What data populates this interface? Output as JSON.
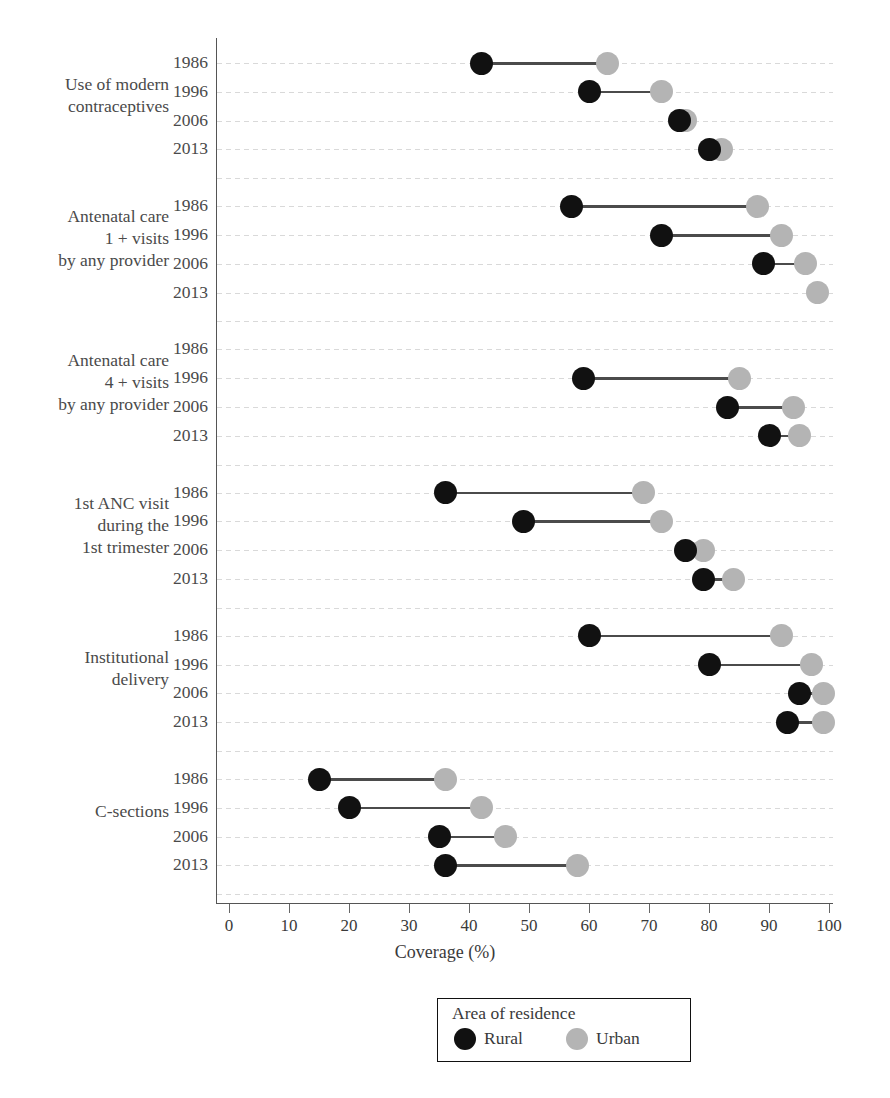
{
  "chart_data": {
    "type": "scatter",
    "subtype": "dumbbell",
    "title": "",
    "xlabel": "Coverage (%)",
    "ylabel": "",
    "xlim": [
      0,
      100
    ],
    "xticks": [
      0,
      10,
      20,
      30,
      40,
      50,
      60,
      70,
      80,
      90,
      100
    ],
    "grid": true,
    "legend": {
      "title": "Area of residence",
      "position": "bottom-center",
      "entries": [
        {
          "name": "Rural",
          "color": "#111111"
        },
        {
          "name": "Urban",
          "color": "#b4b4b4"
        }
      ]
    },
    "series": [
      {
        "name": "Rural",
        "color": "#111111"
      },
      {
        "name": "Urban",
        "color": "#b4b4b4"
      }
    ],
    "groups": [
      {
        "label": "Use of modern\ncontraceptives",
        "label_lines": [
          "Use of modern",
          "contraceptives"
        ],
        "rows": [
          {
            "year": "1986",
            "Rural": 42,
            "Urban": 63
          },
          {
            "year": "1996",
            "Rural": 60,
            "Urban": 72
          },
          {
            "year": "2006",
            "Rural": 75,
            "Urban": 76
          },
          {
            "year": "2013",
            "Rural": 80,
            "Urban": 82
          }
        ]
      },
      {
        "label": "Antenatal care\n1 + visits\nby any provider",
        "label_lines": [
          "Antenatal care",
          "1 + visits",
          "by any provider"
        ],
        "rows": [
          {
            "year": "1986",
            "Rural": 57,
            "Urban": 88
          },
          {
            "year": "1996",
            "Rural": 72,
            "Urban": 92
          },
          {
            "year": "2006",
            "Rural": 89,
            "Urban": 96
          },
          {
            "year": "2013",
            "Rural": null,
            "Urban": 98
          }
        ]
      },
      {
        "label": "Antenatal care\n4 + visits\nby any provider",
        "label_lines": [
          "Antenatal care",
          "4 + visits",
          "by any provider"
        ],
        "rows": [
          {
            "year": "1986",
            "Rural": null,
            "Urban": null
          },
          {
            "year": "1996",
            "Rural": 59,
            "Urban": 85
          },
          {
            "year": "2006",
            "Rural": 83,
            "Urban": 94
          },
          {
            "year": "2013",
            "Rural": 90,
            "Urban": 95
          }
        ]
      },
      {
        "label": "1st ANC visit\nduring the\n1st trimester",
        "label_lines": [
          "1st ANC visit",
          "during the",
          "1st trimester"
        ],
        "rows": [
          {
            "year": "1986",
            "Rural": 36,
            "Urban": 69
          },
          {
            "year": "1996",
            "Rural": 49,
            "Urban": 72
          },
          {
            "year": "2006",
            "Rural": 76,
            "Urban": 79
          },
          {
            "year": "2013",
            "Rural": 79,
            "Urban": 84
          }
        ]
      },
      {
        "label": "Institutional\ndelivery",
        "label_lines": [
          "Institutional",
          "delivery"
        ],
        "rows": [
          {
            "year": "1986",
            "Rural": 60,
            "Urban": 92
          },
          {
            "year": "1996",
            "Rural": 80,
            "Urban": 97
          },
          {
            "year": "2006",
            "Rural": 95,
            "Urban": 99
          },
          {
            "year": "2013",
            "Rural": 93,
            "Urban": 99
          }
        ]
      },
      {
        "label": "C-sections",
        "label_lines": [
          "C-sections"
        ],
        "rows": [
          {
            "year": "1986",
            "Rural": 15,
            "Urban": 36
          },
          {
            "year": "1996",
            "Rural": 20,
            "Urban": 42
          },
          {
            "year": "2006",
            "Rural": 35,
            "Urban": 46
          },
          {
            "year": "2013",
            "Rural": 36,
            "Urban": 58
          }
        ]
      }
    ]
  },
  "axis": {
    "x_title": "Coverage (%)",
    "x_tick_labels": [
      "0",
      "10",
      "20",
      "30",
      "40",
      "50",
      "60",
      "70",
      "80",
      "90",
      "100"
    ]
  },
  "legend": {
    "title": "Area of residence",
    "rural_label": "Rural",
    "urban_label": "Urban"
  },
  "colors": {
    "rural": "#111111",
    "urban": "#b4b4b4",
    "axis": "#555555",
    "grid": "#d9d9d9",
    "text": "#3a3a3a"
  }
}
